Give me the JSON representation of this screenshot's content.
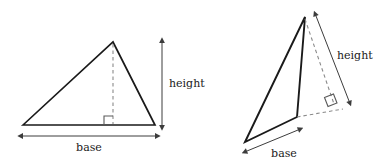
{
  "figure": {
    "background_color": "#ffffff",
    "stroke_color": "#1a1a1a",
    "dash_color": "#777777",
    "arrow_color": "#4a4a4a",
    "labels": {
      "base": "base",
      "height": "height"
    }
  },
  "diagrams": [
    {
      "name": "acute-triangle",
      "description": "Acute triangle with interior altitude drawn from apex to base",
      "vertices": [
        {
          "name": "left-vertex",
          "x": 23,
          "y": 125
        },
        {
          "name": "apex",
          "x": 113,
          "y": 42
        },
        {
          "name": "right-vertex",
          "x": 155,
          "y": 125
        }
      ],
      "altitude": {
        "from_x": 113,
        "from_y": 42,
        "to_x": 113,
        "to_y": 125,
        "style": "dashed"
      },
      "right_angle_marker": {
        "x": 104,
        "y": 116,
        "size": 9
      },
      "base_measure": {
        "x1": 23,
        "y1": 136,
        "x2": 155,
        "y2": 136,
        "label": "base",
        "label_x": 90,
        "label_y": 151
      },
      "height_measure": {
        "x1": 162,
        "y1": 43,
        "x2": 162,
        "y2": 124,
        "label": "height",
        "label_x": 169,
        "label_y": 87
      }
    },
    {
      "name": "obtuse-triangle",
      "description": "Obtuse triangle with exterior altitude drawn to the extended base line",
      "vertices": [
        {
          "name": "bottom-left-vertex",
          "x": 245,
          "y": 142
        },
        {
          "name": "apex",
          "x": 305,
          "y": 17
        },
        {
          "name": "bottom-right-vertex",
          "x": 297,
          "y": 117
        }
      ],
      "base_extension": {
        "from_x": 297,
        "from_y": 117,
        "to_x": 341,
        "to_y": 109,
        "style": "dashed"
      },
      "altitude": {
        "from_x": 305,
        "from_y": 17,
        "to_x": 333,
        "to_y": 103,
        "style": "dashed"
      },
      "right_angle_marker": {
        "x": 326,
        "y": 94,
        "size": 10,
        "rotation": -10
      },
      "base_measure": {
        "x1": 247,
        "y1": 151,
        "x2": 297,
        "y2": 130,
        "label": "base",
        "label_x": 272,
        "label_y": 157
      },
      "height_measure": {
        "x1": 316,
        "y1": 16,
        "x2": 349,
        "y2": 101,
        "label": "height",
        "label_x": 337,
        "label_y": 59
      }
    }
  ]
}
